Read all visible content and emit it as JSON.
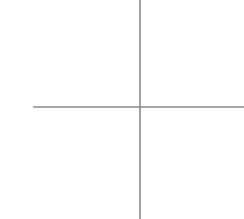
{
  "problem": {
    "number_label": "4)"
  },
  "chart_data": {
    "type": "line",
    "title": "",
    "xlabel": "",
    "ylabel": "",
    "xlim": [
      -5,
      4.7
    ],
    "ylim": [
      -5,
      5
    ],
    "grid": true,
    "x_tick_labels": [
      "-4",
      "-3",
      "-2",
      "-1",
      "1",
      "2",
      "3",
      "4"
    ],
    "y_tick_labels": [
      "4",
      "3",
      "2",
      "1",
      "-1",
      "-2",
      "-3",
      "-4"
    ],
    "x_ticks": [
      -4,
      -3,
      -2,
      -1,
      1,
      2,
      3,
      4
    ],
    "y_ticks": [
      4,
      3,
      2,
      1,
      -1,
      -2,
      -3,
      -4
    ],
    "series": [
      {
        "name": "vertical line x = 4",
        "equation": "x = 4",
        "points": [
          [
            4,
            -5
          ],
          [
            4,
            5
          ]
        ],
        "color": "#333333"
      }
    ]
  },
  "colors": {
    "grid": "#e4e4e4",
    "axis": "#8a8a8a",
    "line": "#333333",
    "text": "#333333"
  }
}
